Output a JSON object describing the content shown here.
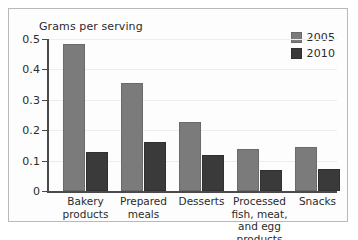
{
  "chart_data": {
    "type": "bar",
    "title": "",
    "subtitle": "",
    "xlabel": "",
    "ylabel": "Grams per serving",
    "ylim": [
      0,
      0.5
    ],
    "ytick_labels": [
      "0",
      "0.1",
      "0.2",
      "0.3",
      "0.4",
      "0.5"
    ],
    "ytick_values": [
      0,
      0.1,
      0.2,
      0.3,
      0.4,
      0.5
    ],
    "grid": true,
    "legend_position": "top-right",
    "categories": [
      "Bakery\nproducts",
      "Prepared\nmeals",
      "Desserts",
      "Processed\nfish, meat,\nand egg products",
      "Snacks"
    ],
    "series": [
      {
        "name": "2005",
        "color": "#7b7b7b",
        "values": [
          0.485,
          0.355,
          0.228,
          0.138,
          0.145
        ]
      },
      {
        "name": "2010",
        "color": "#3a3a3a",
        "values": [
          0.128,
          0.162,
          0.118,
          0.07,
          0.074
        ]
      }
    ]
  },
  "legend": {
    "items": [
      {
        "label": "2005"
      },
      {
        "label": "2010"
      }
    ]
  }
}
